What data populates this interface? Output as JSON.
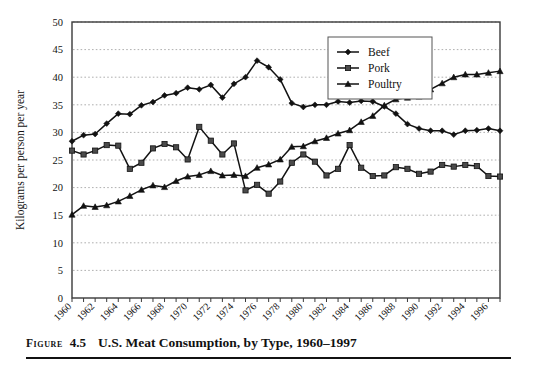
{
  "caption": {
    "figure_word": "Figure",
    "number": "4.5",
    "title": "U.S. Meat Consumption, by Type, 1960–1997"
  },
  "axes": {
    "ylabel": "Kilograms per person per year",
    "xlabel": "",
    "y_ticks": [
      "0",
      "5",
      "10",
      "15",
      "20",
      "25",
      "30",
      "35",
      "40",
      "45",
      "50"
    ],
    "x_ticks": [
      "1960",
      "1962",
      "1964",
      "1966",
      "1968",
      "1970",
      "1972",
      "1974",
      "1976",
      "1978",
      "1980",
      "1982",
      "1984",
      "1986",
      "1988",
      "1990",
      "1992",
      "1994",
      "1996"
    ]
  },
  "legend": {
    "position": "top-right",
    "entries": [
      {
        "label": "Beef",
        "marker": "diamond-icon",
        "color": "#121212"
      },
      {
        "label": "Pork",
        "marker": "square-icon",
        "color": "#4a4a4a"
      },
      {
        "label": "Poultry",
        "marker": "triangle-icon",
        "color": "#121212"
      }
    ]
  },
  "chart_data": {
    "type": "line",
    "title": "U.S. Meat Consumption, by Type, 1960–1997",
    "xlabel": "",
    "ylabel": "Kilograms per person per year",
    "xlim": [
      1960,
      1997
    ],
    "ylim": [
      0,
      50
    ],
    "ytick_step": 5,
    "xtick_step": 1,
    "xtick_label_step": 2,
    "grid": "horizontal-dotted",
    "x": [
      1960,
      1961,
      1962,
      1963,
      1964,
      1965,
      1966,
      1967,
      1968,
      1969,
      1970,
      1971,
      1972,
      1973,
      1974,
      1975,
      1976,
      1977,
      1978,
      1979,
      1980,
      1981,
      1982,
      1983,
      1984,
      1985,
      1986,
      1987,
      1988,
      1989,
      1990,
      1991,
      1992,
      1993,
      1994,
      1995,
      1996,
      1997
    ],
    "series": [
      {
        "name": "Beef",
        "marker": "diamond",
        "color": "#121212",
        "values": [
          28.4,
          29.5,
          29.7,
          31.6,
          33.4,
          33.3,
          34.9,
          35.5,
          36.7,
          37.1,
          38.1,
          37.8,
          38.6,
          36.3,
          38.8,
          40.0,
          43.0,
          41.8,
          39.6,
          35.3,
          34.6,
          35.0,
          35.0,
          35.6,
          35.4,
          35.7,
          35.6,
          34.7,
          33.4,
          31.5,
          30.7,
          30.3,
          30.3,
          29.6,
          30.3,
          30.4,
          30.7,
          30.3
        ]
      },
      {
        "name": "Pork",
        "marker": "square",
        "color": "#4a4a4a",
        "values": [
          26.7,
          26.0,
          26.7,
          27.7,
          27.6,
          23.4,
          24.5,
          27.1,
          27.9,
          27.3,
          25.1,
          31.0,
          28.5,
          26.0,
          28.0,
          19.5,
          20.5,
          18.9,
          21.1,
          24.5,
          26.0,
          24.7,
          22.2,
          23.4,
          27.7,
          23.6,
          22.1,
          22.2,
          23.7,
          23.4,
          22.5,
          22.9,
          24.1,
          23.8,
          24.1,
          23.9,
          22.1,
          22.0
        ]
      },
      {
        "name": "Poultry",
        "marker": "triangle",
        "color": "#121212",
        "values": [
          15.1,
          16.7,
          16.5,
          16.8,
          17.5,
          18.5,
          19.6,
          20.4,
          20.1,
          21.2,
          22.0,
          22.3,
          23.0,
          22.2,
          22.3,
          22.1,
          23.6,
          24.2,
          25.1,
          27.4,
          27.5,
          28.4,
          29.0,
          29.8,
          30.4,
          31.9,
          33.0,
          34.9,
          36.0,
          36.3,
          36.5,
          37.8,
          38.9,
          40.0,
          40.5,
          40.5,
          40.8,
          41.1
        ]
      }
    ]
  }
}
